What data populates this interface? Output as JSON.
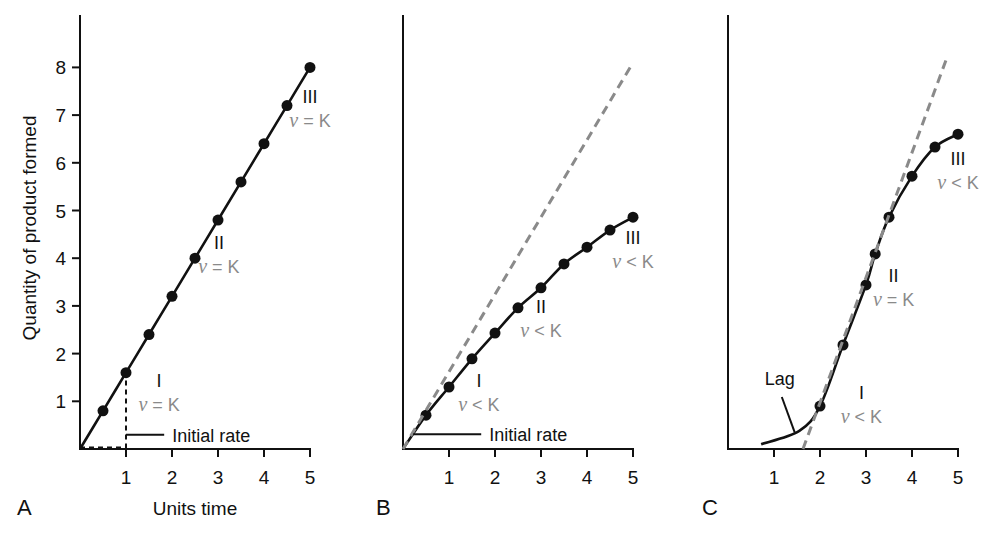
{
  "chart_data": [
    {
      "panel": "A",
      "type": "line",
      "xlabel": "Units time",
      "ylabel": "Quantity of product formed",
      "x_ticks": [
        1,
        2,
        3,
        4,
        5
      ],
      "y_ticks": [
        1,
        2,
        3,
        4,
        5,
        6,
        7,
        8
      ],
      "xlim": [
        0,
        5
      ],
      "ylim": [
        0,
        8.8
      ],
      "grid": false,
      "series": [
        {
          "name": "Product formed",
          "x": [
            0.5,
            1,
            1.5,
            2,
            2.5,
            3,
            3.5,
            4,
            4.5,
            5
          ],
          "values": [
            0.8,
            1.6,
            2.4,
            3.2,
            4.0,
            4.8,
            5.6,
            6.4,
            7.2,
            8.0
          ],
          "line_from_origin": true
        }
      ],
      "guides": [
        {
          "type": "dashed",
          "x": [
            0,
            1,
            1
          ],
          "y": [
            0.03,
            0.03,
            1.45
          ]
        }
      ],
      "regions": [
        {
          "label": "I",
          "rate": "ν = K",
          "x": 1.72,
          "y": 1.3
        },
        {
          "label": "II",
          "rate": "ν = K",
          "x": 3.02,
          "y": 4.2
        },
        {
          "label": "III",
          "rate": "ν = K",
          "x": 5.0,
          "y": 7.25
        }
      ],
      "annotations": [
        {
          "text": "Initial rate",
          "pointer_from": [
            1.0,
            0.3
          ],
          "pointer_to": [
            1.83,
            0.3
          ]
        }
      ]
    },
    {
      "panel": "B",
      "type": "line",
      "xlabel": "",
      "ylabel": "",
      "x_ticks": [
        1,
        2,
        3,
        4,
        5
      ],
      "xlim": [
        0,
        5
      ],
      "ylim": [
        0,
        8.8
      ],
      "grid": false,
      "series": [
        {
          "name": "Product formed",
          "x": [
            0.5,
            1,
            1.5,
            2,
            2.5,
            3,
            3.5,
            4,
            4.5,
            5
          ],
          "values": [
            0.71,
            1.3,
            1.89,
            2.43,
            2.96,
            3.38,
            3.88,
            4.23,
            4.59,
            4.86
          ],
          "line_from_origin": true
        },
        {
          "name": "Initial rate tangent",
          "style": "dashed",
          "x": [
            0,
            5
          ],
          "values": [
            0,
            8.1
          ]
        }
      ],
      "regions": [
        {
          "label": "I",
          "rate": "ν < K",
          "x": 1.65,
          "y": 1.3
        },
        {
          "label": "II",
          "rate": "ν < K",
          "x": 3.0,
          "y": 2.85
        },
        {
          "label": "III",
          "rate": "ν < K",
          "x": 5.0,
          "y": 4.3
        }
      ],
      "annotations": [
        {
          "text": "Initial rate",
          "pointer_from": [
            0.22,
            0.31
          ],
          "pointer_to": [
            1.7,
            0.31
          ]
        }
      ]
    },
    {
      "panel": "C",
      "type": "line",
      "xlabel": "",
      "ylabel": "",
      "x_ticks": [
        1,
        2,
        3,
        4,
        5
      ],
      "xlim": [
        0,
        5
      ],
      "ylim": [
        0,
        8.8
      ],
      "grid": false,
      "series": [
        {
          "name": "Product formed",
          "x": [
            2.0,
            2.5,
            3.0,
            3.2,
            3.5,
            4.0,
            4.5,
            5.0
          ],
          "values": [
            0.9,
            2.18,
            3.44,
            4.09,
            4.86,
            5.72,
            6.33,
            6.6
          ],
          "curve_start": [
            0.72,
            0.1
          ]
        },
        {
          "name": "Linear-phase tangent",
          "style": "dashed",
          "x": [
            1.63,
            4.78
          ],
          "values": [
            0,
            8.26
          ]
        }
      ],
      "regions": [
        {
          "label": "I",
          "rate": "ν < K",
          "x": 2.9,
          "y": 1.05
        },
        {
          "label": "II",
          "rate": "ν = K",
          "x": 3.6,
          "y": 3.5
        },
        {
          "label": "III",
          "rate": "ν < K",
          "x": 5.0,
          "y": 5.95
        }
      ],
      "annotations": [
        {
          "text": "Lag",
          "pointer_from": [
            1.17,
            1.09
          ],
          "pointer_to": [
            1.45,
            0.35
          ]
        }
      ]
    }
  ],
  "labels": {
    "ylabel": "Quantity of product formed",
    "xlabel": "Units time",
    "initial_rate": "Initial rate",
    "lag": "Lag",
    "panel_a": "A",
    "panel_b": "B",
    "panel_c": "C"
  },
  "colors": {
    "curve": "#111111",
    "dashed_tangent": "#8a8a8a",
    "rate_text": "#8a8a8a",
    "axis": "#111111"
  }
}
